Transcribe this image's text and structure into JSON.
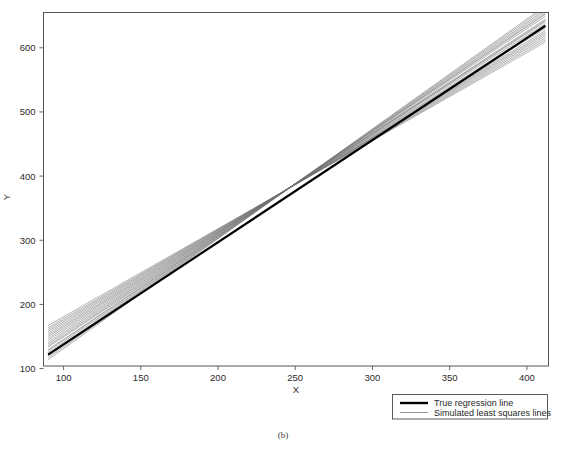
{
  "figure": {
    "caption": "(b)",
    "background_color": "#ffffff"
  },
  "chart_data": {
    "type": "line",
    "title": "",
    "xlabel": "X",
    "ylabel": "Y",
    "xlim": [
      87,
      414
    ],
    "ylim": [
      104,
      655
    ],
    "xticks": [
      100,
      150,
      200,
      250,
      300,
      350,
      400
    ],
    "xticklabels": [
      "100",
      "150",
      "200",
      "250",
      "300",
      "350",
      "400"
    ],
    "yticks": [
      100,
      200,
      300,
      400,
      500,
      600
    ],
    "yticklabels": [
      "100",
      "200",
      "300",
      "400",
      "500",
      "600"
    ],
    "grid": false,
    "legend_position": "outside-bottom-right",
    "x_domain": [
      90,
      412
    ],
    "true_line": {
      "name": "True regression line",
      "color": "#000000",
      "linewidth": 2.2,
      "intercept": -21.5,
      "slope": 1.592,
      "endpoints": [
        [
          90,
          121.8
        ],
        [
          412,
          634.4
        ]
      ]
    },
    "simulated_lines": {
      "name": "Simulated least squares lines",
      "color": "#6f6f6f",
      "linewidth": 0.55,
      "count": 20,
      "pivot_x": 250,
      "coefficients": [
        {
          "intercept": 7.5,
          "slope": 1.5195
        },
        {
          "intercept": -2.1,
          "slope": 1.5605
        },
        {
          "intercept": -9.4,
          "slope": 1.5875
        },
        {
          "intercept": -15.8,
          "slope": 1.614
        },
        {
          "intercept": -22.6,
          "slope": 1.642
        },
        {
          "intercept": -31.0,
          "slope": 1.676
        },
        {
          "intercept": -40.2,
          "slope": 1.7125
        },
        {
          "intercept": 16.9,
          "slope": 1.4805
        },
        {
          "intercept": 25.4,
          "slope": 1.4465
        },
        {
          "intercept": 34.1,
          "slope": 1.411
        },
        {
          "intercept": 43.6,
          "slope": 1.3725
        },
        {
          "intercept": 2.3,
          "slope": 1.542
        },
        {
          "intercept": -6.2,
          "slope": 1.575
        },
        {
          "intercept": 12.1,
          "slope": 1.501
        },
        {
          "intercept": 20.8,
          "slope": 1.464
        },
        {
          "intercept": -18.4,
          "slope": 1.6275
        },
        {
          "intercept": -27.1,
          "slope": 1.66
        },
        {
          "intercept": 29.7,
          "slope": 1.429
        },
        {
          "intercept": 38.4,
          "slope": 1.393
        },
        {
          "intercept": -35.6,
          "slope": 1.6945
        }
      ]
    },
    "legend": [
      {
        "label": "True regression line",
        "color": "#000000",
        "linewidth": 2.4
      },
      {
        "label": "Simulated least squares lines",
        "color": "#7a7a7a",
        "linewidth": 0.7
      }
    ]
  }
}
